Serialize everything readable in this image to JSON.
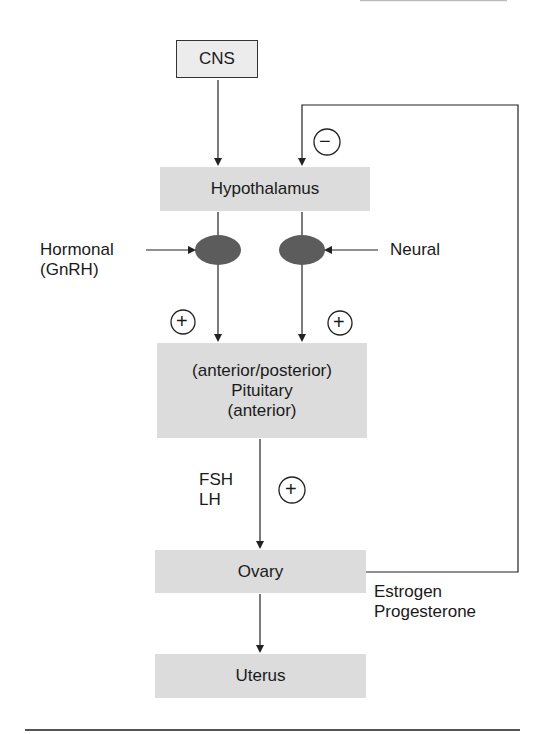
{
  "diagram": {
    "nodes": {
      "cns": "CNS",
      "hypothalamus": "Hypothalamus",
      "pituitary": [
        "(anterior/posterior)",
        "Pituitary",
        "(anterior)"
      ],
      "ovary": "Ovary",
      "uterus": "Uterus"
    },
    "labels": {
      "hormonal": [
        "Hormonal",
        "(GnRH)"
      ],
      "neural": "Neural",
      "gonadotropins": [
        "FSH",
        "LH"
      ],
      "ovarian_hormones": [
        "Estrogen",
        "Progesterone"
      ]
    },
    "signs": {
      "negative_feedback": "−",
      "positive_left": "+",
      "positive_right": "+",
      "positive_fsh_lh": "+"
    },
    "colors": {
      "box_fill": "#dcdcdc",
      "oval_fill": "#5c5c5c",
      "line": "#222222"
    }
  }
}
